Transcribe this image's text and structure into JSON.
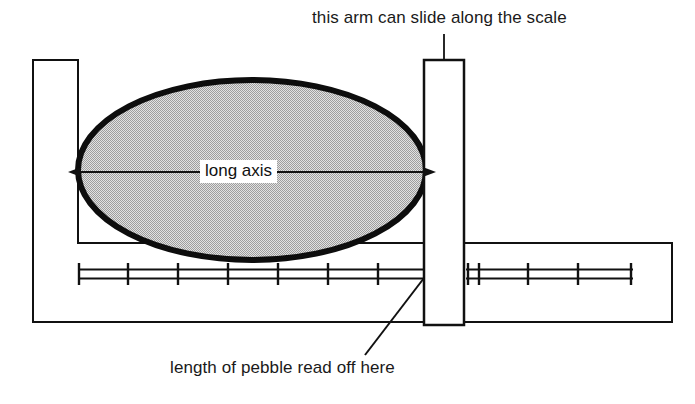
{
  "figure": {
    "title_text": "",
    "type": "technical-diagram",
    "background_color": "#ffffff",
    "ink_color": "#111111"
  },
  "annotations": {
    "top_caption": "this arm can slide along the scale",
    "bottom_caption": "length of pebble read off here",
    "axis_label": "long axis"
  },
  "parts": {
    "fixed_jaw": {
      "name": "fixed jaw",
      "x": 33,
      "y": 60,
      "width": 45,
      "height": 183
    },
    "sliding_arm": {
      "name": "sliding arm",
      "x": 424,
      "y": 60,
      "width": 40,
      "height": 265,
      "fill": "#ffffff",
      "stroke": "#111111"
    },
    "body_base": {
      "name": "caliper body",
      "left": 33,
      "top": 243,
      "right": 672,
      "bottom": 322
    },
    "pebble": {
      "name": "pebble",
      "center_x": 252,
      "center_y": 170,
      "radius_x": 174,
      "radius_y": 90,
      "fill": "#c9c9c9",
      "stroke": "#0d0d0d",
      "stroke_width": 6
    }
  },
  "scale": {
    "name": "measuring scale",
    "axis_y": 274,
    "bar_gap": 9,
    "left_segment": {
      "start_x": 78,
      "end_x": 424,
      "tick_positions": [
        78,
        128,
        178,
        228,
        278,
        328,
        378,
        422
      ]
    },
    "right_segment": {
      "start_x": 466,
      "end_x": 633,
      "tick_positions": [
        468,
        478,
        527,
        578,
        632
      ]
    },
    "tick_height": 22
  },
  "leaders": {
    "top_leader": {
      "name": "top leader line",
      "x1": 444,
      "y1": 34,
      "x2": 444,
      "y2": 60
    },
    "bottom_leader": {
      "name": "bottom leader line",
      "x1": 365,
      "y1": 355,
      "x2": 424,
      "y2": 278
    }
  },
  "long_axis_arrow": {
    "name": "long axis arrow",
    "y": 172,
    "x_left": 80,
    "x_right": 424
  }
}
